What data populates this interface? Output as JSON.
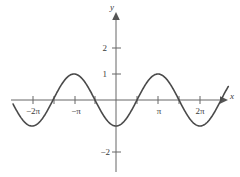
{
  "chart_data": {
    "type": "line",
    "title": "",
    "xlabel": "x",
    "ylabel": "y",
    "function": "y = -cos(x)",
    "xlim": [
      -7.7,
      8.4
    ],
    "ylim": [
      -2.9,
      3.2
    ],
    "grid": false,
    "legend": null,
    "x_axis": {
      "label": "x",
      "tick_labels": [
        "-2π",
        "-π",
        "π",
        "2π"
      ],
      "tick_values": [
        -6.283185,
        -3.141593,
        3.141593,
        6.283185
      ],
      "minor_tick_values": [
        -6.283185,
        -4.712389,
        -3.141593,
        -1.570796,
        1.570796,
        3.141593,
        4.712389,
        6.283185
      ],
      "arrow": true
    },
    "y_axis": {
      "label": "y",
      "tick_labels": [
        "2",
        "1",
        "-2"
      ],
      "tick_values": [
        2,
        1,
        -2
      ],
      "arrow": true
    },
    "series": [
      {
        "name": "y = -cos(x)",
        "color": "#4a4a4a",
        "amplitude": 1,
        "period": 6.283185,
        "phase_shift": 3.141593,
        "vertical_shift": 0,
        "x_start": -7.7,
        "x_end": 8.4,
        "key_points": [
          {
            "x": -6.283185,
            "y": -1,
            "kind": "minimum"
          },
          {
            "x": -4.712389,
            "y": 0,
            "kind": "zero"
          },
          {
            "x": -3.141593,
            "y": 1,
            "kind": "maximum"
          },
          {
            "x": -1.570796,
            "y": 0,
            "kind": "zero"
          },
          {
            "x": 0,
            "y": -1,
            "kind": "minimum"
          },
          {
            "x": 1.570796,
            "y": 0,
            "kind": "zero"
          },
          {
            "x": 3.141593,
            "y": 1,
            "kind": "maximum"
          },
          {
            "x": 4.712389,
            "y": 0,
            "kind": "zero"
          },
          {
            "x": 6.283185,
            "y": -1,
            "kind": "minimum"
          }
        ]
      }
    ]
  },
  "figure": {
    "background_color": "#ffffff",
    "axis_color": "#666666",
    "curve_color": "#4a4a4a",
    "text_color": "#3a3a3a",
    "x_tick_labels": [
      {
        "text": "−2π",
        "x": 33,
        "y": 114
      },
      {
        "text": "−π",
        "x": 76,
        "y": 114
      },
      {
        "text": "π",
        "x": 159,
        "y": 114
      },
      {
        "text": "2π",
        "x": 200,
        "y": 114
      }
    ],
    "y_tick_labels": [
      {
        "text": "2",
        "x": 107,
        "y": 51
      },
      {
        "text": "1",
        "x": 107,
        "y": 77
      },
      {
        "text": "−2",
        "x": 104,
        "y": 155
      }
    ],
    "x_axis_label": {
      "text": "x",
      "x": 232,
      "y": 98
    },
    "y_axis_label": {
      "text": "y",
      "x": 112,
      "y": 10
    }
  }
}
